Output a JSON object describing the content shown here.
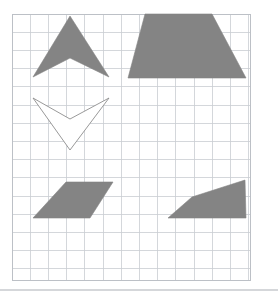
{
  "figure": {
    "background_color": "#ffffff",
    "grid": {
      "columns": 13,
      "rows": 14,
      "cell_size_px": 18.2,
      "left_px": 12,
      "top_px": 14,
      "right_px": 250,
      "bottom_px": 280,
      "line_color": "#c9cdd2",
      "border_color": "#bcc0c6",
      "visible": true
    },
    "fill_color": "#848484",
    "outline_color": "#8d8d8d",
    "baseline_rule": {
      "color": "#d5d7da",
      "y_px": 290
    },
    "shapes": [
      {
        "name": "chevron-up-filled",
        "description": "Filled gray concave arrowhead pointing up",
        "style": "filled",
        "points": "70,16 109,77 70,58 33,77"
      },
      {
        "name": "trapezoid-filled",
        "description": "Filled gray isosceles trapezoid, long side down",
        "style": "filled",
        "points": "145,14 212,14 246,78 128,78"
      },
      {
        "name": "chevron-down-outline",
        "description": "White chevron with gray outline pointing down",
        "style": "outline",
        "points": "33,98 70,119 109,98 70,150"
      },
      {
        "name": "parallelogram-filled",
        "description": "Filled gray parallelogram slanting right",
        "style": "filled",
        "points": "66,182 113,182 90,218 33,218"
      },
      {
        "name": "right-trapezoid-filled",
        "description": "Filled gray trapezoid with peak at upper right",
        "style": "filled",
        "points": "245,180 246,218 168,218 192,197"
      }
    ]
  }
}
